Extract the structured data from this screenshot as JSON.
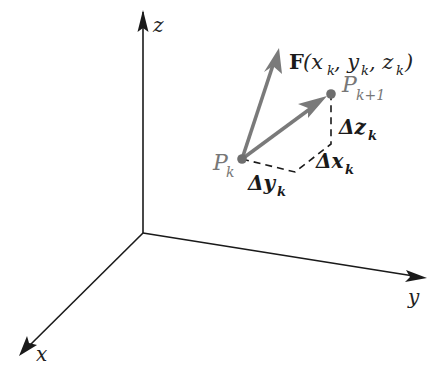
{
  "diagram": {
    "axes": {
      "z_label": "z",
      "y_label": "y",
      "x_label": "x"
    },
    "points": {
      "pk": {
        "base": "P",
        "sub": "k"
      },
      "pk1": {
        "base": "P",
        "sub": "k+1"
      }
    },
    "vector_F": {
      "bold": "F",
      "args": "(x",
      "sub1": "k",
      "sep1": ", y",
      "sub2": "k",
      "sep2": ", z",
      "sub3": "k",
      "close": ")"
    },
    "deltas": {
      "dz": {
        "base": "Δz",
        "sub": "k"
      },
      "dx": {
        "base": "Δx",
        "sub": "k"
      },
      "dy": {
        "base": "Δy",
        "sub": "k"
      }
    },
    "colors": {
      "axis": "#1a1a1a",
      "vector": "#7a7a7a",
      "point": "#6e6e6e",
      "dashed": "#1a1a1a"
    }
  }
}
